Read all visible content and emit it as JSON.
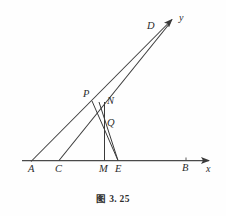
{
  "figure": {
    "caption": "图 3. 25",
    "stroke_color": "#3a3a3a",
    "axis_color": "#4a4a4a",
    "background": "#fefefe",
    "axes": [
      {
        "name": "x",
        "label": "x"
      },
      {
        "name": "y",
        "label": "y"
      }
    ],
    "points": [
      {
        "key": "A",
        "label": "A",
        "x": 31,
        "y": 162,
        "label_x": 28,
        "label_y": 166
      },
      {
        "key": "C",
        "label": "C",
        "x": 59,
        "y": 161,
        "label_x": 55,
        "label_y": 166
      },
      {
        "key": "M",
        "label": "M",
        "x": 104,
        "y": 161,
        "label_x": 99,
        "label_y": 166
      },
      {
        "key": "E",
        "label": "E",
        "x": 118,
        "y": 161,
        "label_x": 116,
        "label_y": 166
      },
      {
        "key": "B",
        "label": "B",
        "x": 186,
        "y": 160,
        "label_x": 182,
        "label_y": 165
      },
      {
        "key": "P",
        "label": "P",
        "x": 93,
        "y": 102,
        "label_x": 85,
        "label_y": 92
      },
      {
        "key": "N",
        "label": "N",
        "x": 104,
        "y": 105,
        "label_x": 108,
        "label_y": 99
      },
      {
        "key": "Q",
        "label": "Q",
        "x": 104,
        "y": 127,
        "label_x": 108,
        "label_y": 121
      },
      {
        "key": "D",
        "label": "D",
        "x": 160,
        "y": 31,
        "label_x": 148,
        "label_y": 23
      }
    ],
    "axis_labels": [
      {
        "key": "x",
        "label": "x",
        "label_x": 205,
        "label_y": 166
      },
      {
        "key": "y",
        "label": "y",
        "label_x": 179,
        "label_y": 14
      }
    ],
    "segments": [
      {
        "name": "x-axis",
        "x1": 22,
        "y1": 160,
        "x2": 211,
        "y2": 160
      },
      {
        "name": "ray-A-to-y",
        "x1": 31,
        "y1": 162,
        "x2": 173,
        "y2": 19
      },
      {
        "name": "ray-C-to-D",
        "x1": 59,
        "y1": 161,
        "x2": 172,
        "y2": 22
      },
      {
        "name": "segment-E-to-D",
        "x1": 118,
        "y1": 161,
        "x2": 98,
        "y2": 103
      },
      {
        "name": "segment-P-to-E",
        "x1": 93,
        "y1": 102,
        "x2": 118,
        "y2": 161
      },
      {
        "name": "segment-M-to-N",
        "x1": 104,
        "y1": 161,
        "x2": 104,
        "y2": 103
      }
    ],
    "tick_marks": [
      {
        "name": "tick-B",
        "x": 186,
        "y": 160
      }
    ]
  }
}
